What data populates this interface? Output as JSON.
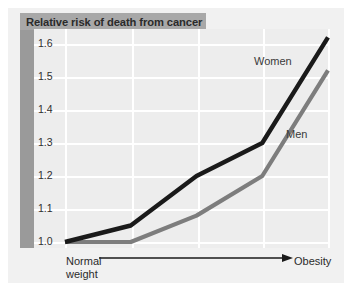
{
  "figure": {
    "title": "Relative risk of death from cancer",
    "y_axis_ticks": [
      "1.6",
      "1.5",
      "1.4",
      "1.3",
      "1.2",
      "1.1",
      "1.0"
    ],
    "x_axis_left_label_line1": "Normal",
    "x_axis_left_label_line2": "weight",
    "x_axis_right_label": "Obesity",
    "series_labels": {
      "women": "Women",
      "men": "Men"
    },
    "colors": {
      "panel_background": "#ededed",
      "card_background": "#f1f1f1",
      "title_banner": "#a8a8a8",
      "left_band": "#9a9a9a",
      "gridline": "#ffffff",
      "women_line": "#1a1a1a",
      "men_line": "#7d7d7d",
      "axis_arrow": "#1a1a1a",
      "text": "#2b2b2b"
    }
  },
  "chart_data": {
    "type": "line",
    "title": "Relative risk of death from cancer",
    "xlabel": "Body weight category (Normal weight → Obesity)",
    "ylabel": "Relative risk of death from cancer",
    "x": [
      0,
      1,
      2,
      3,
      4
    ],
    "x_tick_labels": [
      "Normal weight",
      "",
      "",
      "",
      "Obesity"
    ],
    "y_tick_labels": [
      "1.0",
      "1.1",
      "1.2",
      "1.3",
      "1.4",
      "1.5",
      "1.6"
    ],
    "ylim": [
      0.97,
      1.64
    ],
    "xlim": [
      0,
      4
    ],
    "grid": true,
    "legend": "inline-annotations",
    "series": [
      {
        "name": "Women",
        "color": "#1a1a1a",
        "values": [
          1.0,
          1.05,
          1.2,
          1.3,
          1.62
        ]
      },
      {
        "name": "Men",
        "color": "#7d7d7d",
        "values": [
          1.0,
          1.0,
          1.08,
          1.2,
          1.52
        ]
      }
    ],
    "annotations": [
      {
        "text": "Women",
        "x": 3.4,
        "y": 1.545
      },
      {
        "text": "Men",
        "x": 3.85,
        "y": 1.32
      }
    ]
  }
}
